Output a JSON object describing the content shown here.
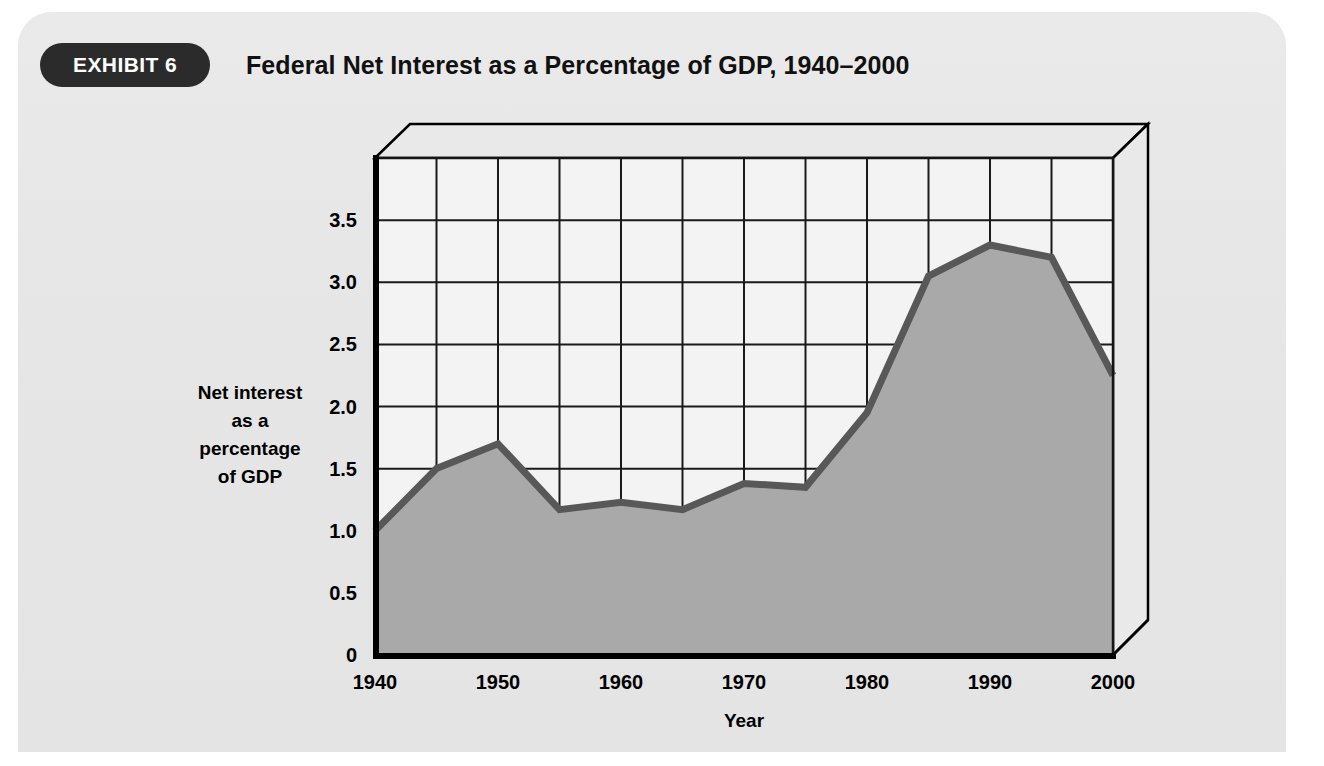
{
  "exhibit": {
    "badge_label": "EXHIBIT 6",
    "title": "Federal Net Interest as a Percentage of GDP, 1940–2000"
  },
  "colors": {
    "panel_background": "#e8e8e8",
    "badge_background": "#2b2b2b",
    "badge_text": "#ffffff",
    "title_text": "#111111",
    "plot_background": "#f2f2f2",
    "area_fill": "#a8a8a8",
    "line_stroke": "#595959",
    "grid_stroke": "#1a1a1a",
    "axis_stroke": "#000000",
    "wall_top": "#e4e4e4"
  },
  "axes": {
    "y_label_lines": [
      "Net interest",
      "as a",
      "percentage",
      "of GDP"
    ],
    "y_ticks": [
      "0",
      "0.5",
      "1.0",
      "1.5",
      "2.0",
      "2.5",
      "3.0",
      "3.5"
    ],
    "x_title": "Year",
    "x_ticks": [
      "1940",
      "1950",
      "1960",
      "1970",
      "1980",
      "1990",
      "2000"
    ]
  },
  "chart_data": {
    "type": "area",
    "title": "Federal Net Interest as a Percentage of GDP, 1940–2000",
    "xlabel": "Year",
    "ylabel": "Net interest as a percentage of GDP",
    "xlim": [
      1940,
      2000
    ],
    "ylim": [
      0,
      4.0
    ],
    "y_tick_values": [
      0,
      0.5,
      1.0,
      1.5,
      2.0,
      2.5,
      3.0,
      3.5
    ],
    "x_tick_values": [
      1940,
      1950,
      1960,
      1970,
      1980,
      1990,
      2000
    ],
    "grid": true,
    "legend": "none",
    "x": [
      1940,
      1945,
      1950,
      1955,
      1960,
      1965,
      1970,
      1975,
      1980,
      1985,
      1990,
      1995,
      2000
    ],
    "values": [
      1.0,
      1.5,
      1.7,
      1.17,
      1.23,
      1.17,
      1.38,
      1.35,
      1.95,
      3.05,
      3.3,
      3.2,
      2.25
    ],
    "series": [
      {
        "name": "Federal net interest as a percentage of GDP",
        "values": [
          1.0,
          1.5,
          1.7,
          1.17,
          1.23,
          1.17,
          1.38,
          1.35,
          1.95,
          3.05,
          3.3,
          3.2,
          2.25
        ]
      }
    ]
  }
}
